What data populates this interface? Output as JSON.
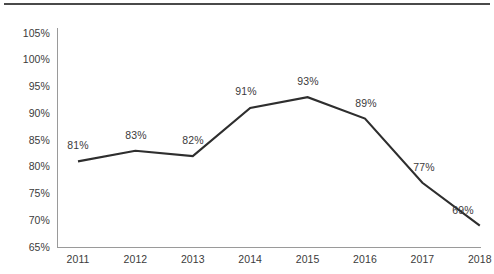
{
  "chart_data": {
    "type": "line",
    "title": "",
    "subtitle": "",
    "xlabel": "",
    "ylabel": "",
    "categories": [
      "2011",
      "2012",
      "2013",
      "2014",
      "2015",
      "2016",
      "2017",
      "2018"
    ],
    "values": [
      81,
      83,
      82,
      91,
      93,
      89,
      77,
      69
    ],
    "data_labels": [
      "81%",
      "83%",
      "82%",
      "91%",
      "93%",
      "89%",
      "77%",
      "69%"
    ],
    "series": [
      {
        "name": "",
        "values": [
          81,
          83,
          82,
          91,
          93,
          89,
          77,
          69
        ]
      }
    ],
    "ylim": [
      65,
      105
    ],
    "ytick_values": [
      65,
      70,
      75,
      80,
      85,
      90,
      95,
      100,
      105
    ],
    "ytick_labels": [
      "65%",
      "70%",
      "75%",
      "80%",
      "85%",
      "90%",
      "95%",
      "100%",
      "105%"
    ],
    "xtick_labels": [
      "2011",
      "2012",
      "2013",
      "2014",
      "2015",
      "2016",
      "2017",
      "2018"
    ],
    "grid": false,
    "legend": false,
    "legend_position": "none",
    "annotations": [],
    "colors": {
      "line": "#2e2e2e",
      "axis": "#9a9a9a",
      "text": "#3b3b3b",
      "top_rule": "#4a4a4a",
      "background": "#ffffff"
    }
  },
  "ytick_positions": [
    247,
    220.25,
    193.5,
    166.75,
    140,
    113.25,
    86.5,
    59.75,
    33
  ],
  "xtick_positions": [
    78,
    135.4,
    192.8,
    250.2,
    307.6,
    365,
    422.4,
    479.8
  ],
  "point_positions": [
    {
      "x": 78,
      "y": 161.3
    },
    {
      "x": 135.4,
      "y": 150.6
    },
    {
      "x": 192.8,
      "y": 155.95
    },
    {
      "x": 250.2,
      "y": 107.8
    },
    {
      "x": 307.6,
      "y": 97.1
    },
    {
      "x": 365,
      "y": 118.5
    },
    {
      "x": 422.4,
      "y": 182.7
    },
    {
      "x": 479.8,
      "y": 225.5
    }
  ],
  "label_positions": [
    {
      "x": 58,
      "y": 140
    },
    {
      "x": 116,
      "y": 130
    },
    {
      "x": 173,
      "y": 135
    },
    {
      "x": 226,
      "y": 86
    },
    {
      "x": 288,
      "y": 76
    },
    {
      "x": 346,
      "y": 98
    },
    {
      "x": 404,
      "y": 162
    },
    {
      "x": 443,
      "y": 205
    }
  ],
  "axes": {
    "y_axis_x": 57,
    "x_axis_y": 247,
    "x_axis_left": 57,
    "x_axis_right": 481,
    "y_axis_top": 28
  }
}
